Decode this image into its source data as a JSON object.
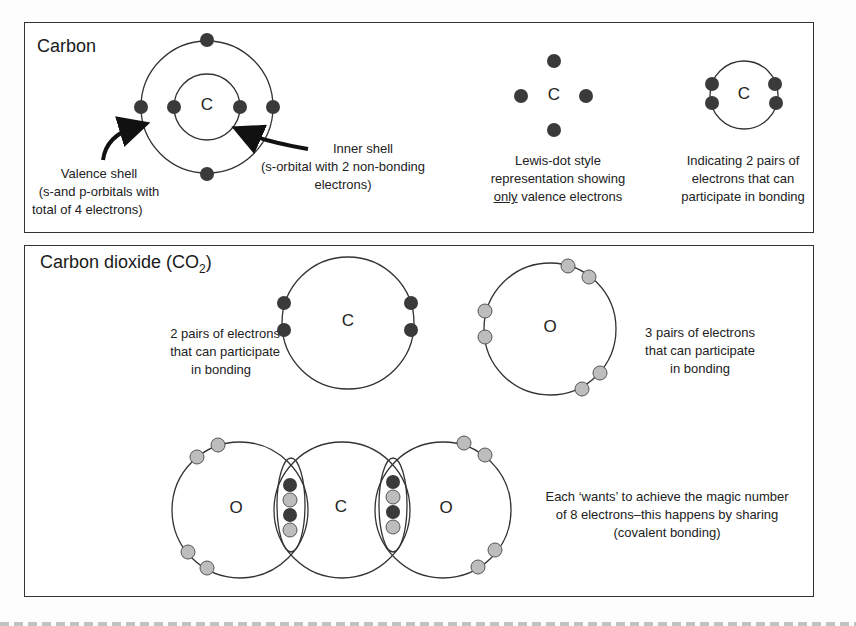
{
  "panel_carbon": {
    "title": "Carbon",
    "atom_symbol": "C",
    "valence_label": [
      "Valence shell",
      "(s-and p-orbitals with",
      "total of 4 electrons)"
    ],
    "inner_label": [
      "Inner shell",
      "(s-orbital with 2 non-bonding",
      "electrons)"
    ],
    "lewis_label_1": "Lewis-dot style",
    "lewis_label_2": "representation showing",
    "lewis_label_3_underlined": "only",
    "lewis_label_3_rest": " valence electrons",
    "pairs_label": [
      "Indicating 2 pairs of",
      "electrons that can",
      "participate in bonding"
    ]
  },
  "panel_co2": {
    "title": "Carbon dioxide (CO",
    "title_subscript": "2",
    "title_end": ")",
    "carbon_symbol": "C",
    "oxygen_symbol": "O",
    "carbon_pairs_label": [
      "2 pairs of electrons",
      "that can participate",
      "in bonding"
    ],
    "oxygen_pairs_label": [
      "3 pairs of electrons",
      "that can participate",
      "in bonding"
    ],
    "molecule_atoms": [
      "O",
      "C",
      "O"
    ],
    "explanation": [
      "Each ‘wants’ to achieve the magic number",
      "of 8 electrons–this happens by sharing",
      "(covalent bonding)"
    ]
  },
  "colors": {
    "carbon_electron": "#3a3a3a",
    "oxygen_electron": "#bdbdbd",
    "line": "#333333"
  }
}
